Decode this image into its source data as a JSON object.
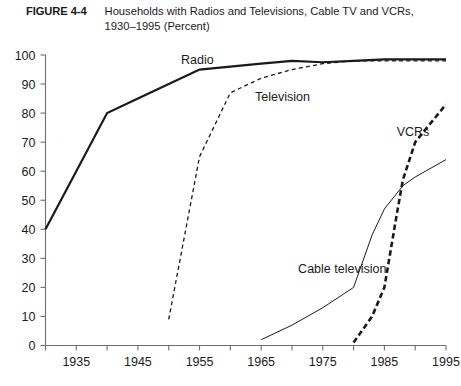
{
  "figure": {
    "label": "FIGURE 4-4",
    "title_line1": "Households with Radios and Televisions, Cable TV and VCRs,",
    "title_line2": "1930–1995 (Percent)"
  },
  "chart_data": {
    "type": "line",
    "title": "Households with Radios and Televisions, Cable TV and VCRs, 1930–1995 (Percent)",
    "xlabel": "",
    "ylabel": "",
    "xlim": [
      1930,
      1995
    ],
    "ylim": [
      0,
      100
    ],
    "grid": false,
    "legend": "inline-labels",
    "y_ticks": [
      0,
      10,
      20,
      30,
      40,
      50,
      60,
      70,
      80,
      90,
      100
    ],
    "x_ticks": [
      1935,
      1945,
      1955,
      1965,
      1975,
      1985,
      1995
    ],
    "x_minor_ticks": [
      1930,
      1935,
      1940,
      1945,
      1950,
      1955,
      1960,
      1965,
      1970,
      1975,
      1980,
      1985,
      1990,
      1995
    ],
    "series": [
      {
        "name": "Radio",
        "style": "solid",
        "label_x": 1952,
        "label_y": 97,
        "x": [
          1930,
          1940,
          1945,
          1950,
          1955,
          1965,
          1970,
          1975,
          1980,
          1985,
          1990,
          1995
        ],
        "values": [
          40,
          80,
          85,
          90,
          95,
          97,
          98,
          97.5,
          98,
          98.5,
          98.5,
          98.5
        ]
      },
      {
        "name": "Television",
        "style": "dashed",
        "label_x": 1964,
        "label_y": 84,
        "x": [
          1950,
          1955,
          1960,
          1965,
          1970,
          1975,
          1980,
          1985,
          1990,
          1995
        ],
        "values": [
          9,
          65,
          87,
          92,
          95,
          97,
          98,
          98,
          98,
          98
        ]
      },
      {
        "name": "Cable television",
        "style": "dash-dot",
        "label_x": 1971,
        "label_y": 25,
        "x": [
          1965,
          1970,
          1975,
          1980,
          1983,
          1985,
          1988,
          1990,
          1995
        ],
        "values": [
          2,
          7,
          13,
          20,
          38,
          47,
          55,
          58,
          64
        ]
      },
      {
        "name": "VCRs",
        "style": "heavy-dashed",
        "label_x": 1987,
        "label_y": 72,
        "x": [
          1980,
          1983,
          1985,
          1987,
          1988,
          1990,
          1995
        ],
        "values": [
          1,
          10,
          20,
          45,
          57,
          70,
          83
        ]
      }
    ]
  }
}
